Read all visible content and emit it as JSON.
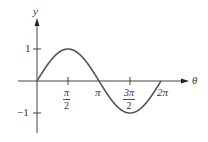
{
  "chart_data": {
    "type": "line",
    "title": "",
    "function": "y = sin(theta)",
    "xlabel": "θ",
    "ylabel": "y",
    "xlim": [
      0,
      6.2832
    ],
    "ylim": [
      -1,
      1
    ],
    "grid": false,
    "legend": null,
    "x_ticks": [
      {
        "value": 1.5708,
        "label_num": "π",
        "label_den": "2"
      },
      {
        "value": 3.1416,
        "label": "π"
      },
      {
        "value": 4.7124,
        "label_num": "3π",
        "label_den": "2"
      },
      {
        "value": 6.2832,
        "label": "2π"
      }
    ],
    "y_ticks": [
      {
        "value": 1,
        "label": "1"
      },
      {
        "value": -1,
        "label": "−1"
      }
    ],
    "series": [
      {
        "name": "sin θ",
        "x": [
          0,
          0.7854,
          1.5708,
          2.3562,
          3.1416,
          3.927,
          4.7124,
          5.4978,
          6.2832
        ],
        "values": [
          0,
          0.707,
          1,
          0.707,
          0,
          -0.707,
          -1,
          -0.707,
          0
        ]
      }
    ],
    "colors": {
      "axis": "#444444",
      "curve": "#555555",
      "text": "#333333"
    }
  },
  "labels": {
    "y_axis": "y",
    "x_axis": "θ",
    "tick_y_pos": "1",
    "tick_y_neg": "−1",
    "tick_pi_half_num": "π",
    "tick_pi_half_den": "2",
    "tick_pi": "π",
    "tick_3pi_half_num": "3π",
    "tick_3pi_half_den": "2",
    "tick_2pi": "2π"
  }
}
